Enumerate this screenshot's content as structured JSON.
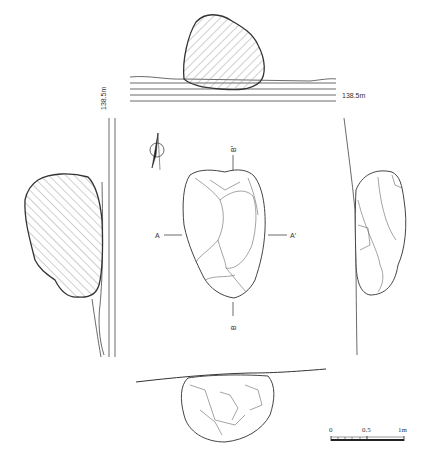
{
  "drawing": {
    "type": "stone plan and section drawing",
    "elevation_top": "138.5m",
    "elevation_left": "138.5m",
    "section_labels": {
      "a": "A",
      "a_prime": "A′",
      "b": "B",
      "b_prime": "B′"
    },
    "north_arrow": "north-arrow",
    "scale_bar": {
      "ticks": [
        "0",
        "0.5",
        "1m"
      ]
    },
    "colors": {
      "line": "#333333",
      "hatch": "#777777",
      "background": "#ffffff"
    }
  }
}
